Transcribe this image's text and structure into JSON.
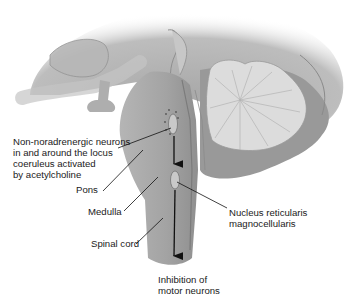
{
  "diagram": {
    "type": "anatomical-illustration",
    "structures": [
      "cerebrum",
      "midbrain",
      "pons",
      "medulla",
      "spinal cord",
      "cerebellum",
      "locus coeruleus region",
      "nucleus reticularis magnocellularis"
    ],
    "labels": {
      "locus": "Non-noradrenergic neurons\nin and around the locus\ncoeruleus activated\nby acetylcholine",
      "pons": "Pons",
      "medulla": "Medulla",
      "spinal_cord": "Spinal cord",
      "nucleus": "Nucleus reticularis\nmagnocellularis",
      "inhibition": "Inhibition of\nmotor neurons"
    },
    "arrows": [
      {
        "from": "locus coeruleus region",
        "to": "nucleus reticularis magnocellularis"
      },
      {
        "from": "nucleus reticularis magnocellularis",
        "to": "spinal cord (motor neurons)"
      }
    ],
    "colors": {
      "tissue_light": "#d6d6d6",
      "tissue_mid": "#a9a9a9",
      "tissue_dark": "#8c8c8c",
      "cerebellum_folia": "#e2e2e2",
      "line": "#111111",
      "background": "#ffffff"
    }
  }
}
